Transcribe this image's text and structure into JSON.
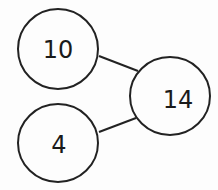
{
  "diagram": {
    "type": "number-bond",
    "whole": {
      "value": "14",
      "cx": 170,
      "cy": 96,
      "r": 37
    },
    "parts": [
      {
        "value": "10",
        "cx": 58,
        "cy": 49,
        "r": 40
      },
      {
        "value": "4",
        "cx": 58,
        "cy": 143,
        "r": 40
      }
    ],
    "colors": {
      "stroke": "#222222",
      "fill": "#fdfdfd",
      "text": "#1a1a1a"
    }
  }
}
